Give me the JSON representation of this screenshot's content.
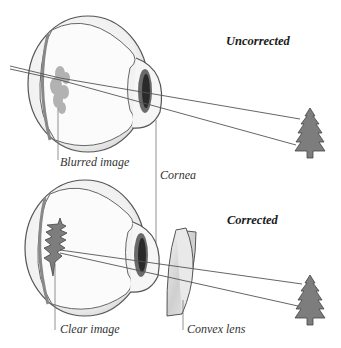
{
  "diagram": {
    "panels": [
      {
        "id": "uncorrected",
        "heading": "Uncorrected",
        "labels": {
          "retina_image": "Blurred image",
          "cornea": "Cornea"
        }
      },
      {
        "id": "corrected",
        "heading": "Corrected",
        "labels": {
          "retina_image": "Clear image",
          "lens": "Convex lens"
        }
      }
    ],
    "colors": {
      "eye_outline": "#555555",
      "sclera_fill": "#f2f2f2",
      "inner_fill": "#fbfbfb",
      "pupil": "#2a2a2a",
      "iris": "#6a6a6a",
      "tree": "#7d7d7d",
      "ray": "#555555",
      "lens_fill": "#e6e6e6"
    }
  }
}
